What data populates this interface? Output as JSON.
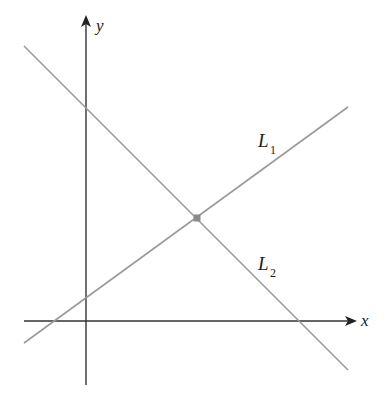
{
  "diagram": {
    "type": "coordinate-plane-two-lines",
    "axes": {
      "x_label": "x",
      "y_label": "y",
      "axis_color": "#333333"
    },
    "lines": [
      {
        "name": "L",
        "subscript": "1",
        "slope_sign": "positive",
        "color": "#9a9a9a"
      },
      {
        "name": "L",
        "subscript": "2",
        "slope_sign": "negative",
        "color": "#9a9a9a"
      }
    ],
    "intersection": {
      "marked": true,
      "color": "#8a8a8a"
    }
  }
}
